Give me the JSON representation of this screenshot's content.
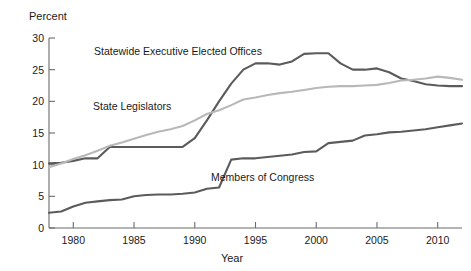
{
  "chart_data": {
    "type": "line",
    "title": "",
    "xlabel": "Year",
    "ylabel": "Percent",
    "xlim": [
      1978,
      2012
    ],
    "ylim": [
      0,
      30
    ],
    "grid": false,
    "legend": "inline-annotations",
    "xticks": [
      1980,
      1985,
      1990,
      1995,
      2000,
      2005,
      2010
    ],
    "xtick_labels": [
      "1980",
      "1985",
      "1990",
      "1995",
      "2000",
      "2005",
      "2010"
    ],
    "yticks": [
      0,
      5,
      10,
      15,
      20,
      25,
      30
    ],
    "ytick_labels": [
      "0",
      "5",
      "10",
      "15",
      "20",
      "25",
      "30"
    ],
    "x": [
      1978,
      1979,
      1980,
      1981,
      1982,
      1983,
      1984,
      1985,
      1986,
      1987,
      1988,
      1989,
      1990,
      1991,
      1992,
      1993,
      1994,
      1995,
      1996,
      1997,
      1998,
      1999,
      2000,
      2001,
      2002,
      2003,
      2004,
      2005,
      2006,
      2007,
      2008,
      2009,
      2010,
      2011,
      2012
    ],
    "series": [
      {
        "name": "Statewide Executive Elected Offices",
        "color": "#5b5b5b",
        "values": [
          10.2,
          10.3,
          10.6,
          11.0,
          11.0,
          12.8,
          12.8,
          12.8,
          12.8,
          12.8,
          12.8,
          12.8,
          14.2,
          17.0,
          20.0,
          22.8,
          25.0,
          26.0,
          26.0,
          25.8,
          26.3,
          27.5,
          27.6,
          27.6,
          26.0,
          25.0,
          25.0,
          25.2,
          24.6,
          23.6,
          23.2,
          22.7,
          22.5,
          22.4,
          22.4
        ],
        "label_text": "Statewide Executive Elected Offices"
      },
      {
        "name": "State Legislators",
        "color": "#b8b8b8",
        "values": [
          9.6,
          10.2,
          10.9,
          11.5,
          12.2,
          13.0,
          13.5,
          14.1,
          14.7,
          15.2,
          15.6,
          16.1,
          17.0,
          18.0,
          18.6,
          19.4,
          20.3,
          20.6,
          21.0,
          21.3,
          21.5,
          21.8,
          22.1,
          22.3,
          22.4,
          22.4,
          22.5,
          22.6,
          22.9,
          23.3,
          23.4,
          23.6,
          23.9,
          23.7,
          23.4
        ],
        "label_text": "State Legislators"
      },
      {
        "name": "Members of Congress",
        "color": "#5b5b5b",
        "values": [
          2.4,
          2.6,
          3.4,
          4.0,
          4.2,
          4.4,
          4.5,
          5.0,
          5.2,
          5.3,
          5.3,
          5.4,
          5.6,
          6.2,
          6.4,
          10.8,
          11.0,
          11.0,
          11.2,
          11.4,
          11.6,
          12.0,
          12.1,
          13.4,
          13.6,
          13.8,
          14.6,
          14.8,
          15.1,
          15.2,
          15.4,
          15.6,
          15.9,
          16.2,
          16.5
        ],
        "label_text": "Members of Congress"
      }
    ],
    "annotations": [
      {
        "text": "Statewide Executive Elected Offices",
        "x_px": 94,
        "y_px": 55
      },
      {
        "text": "State Legislators",
        "x_px": 93,
        "y_px": 110
      },
      {
        "text": "Members of Congress",
        "x_px": 211,
        "y_px": 181
      }
    ]
  }
}
